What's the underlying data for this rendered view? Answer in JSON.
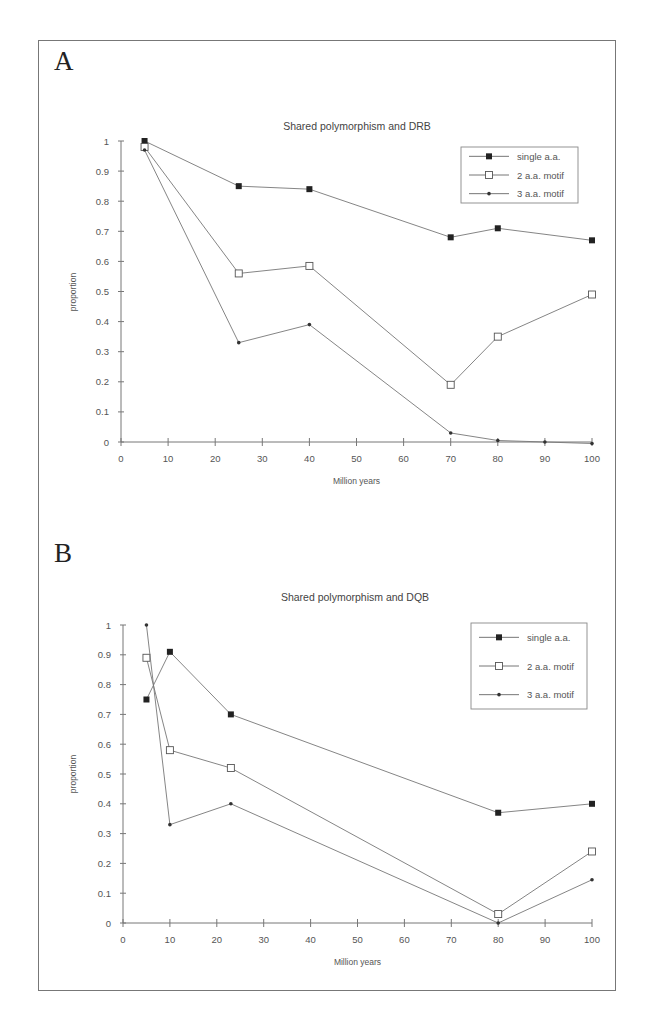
{
  "panels": [
    {
      "letter": "A",
      "title": "Shared polymorphism and DRB"
    },
    {
      "letter": "B",
      "title": "Shared polymorphism and DQB"
    }
  ],
  "chart_data": [
    {
      "type": "line",
      "panel": "A",
      "title": "Shared polymorphism and DRB",
      "xlabel": "Million years",
      "ylabel": "proportion",
      "xlim": [
        0,
        100
      ],
      "ylim": [
        0,
        1
      ],
      "xticks": [
        0,
        10,
        20,
        30,
        40,
        50,
        60,
        70,
        80,
        90,
        100
      ],
      "yticks": [
        0,
        0.1,
        0.2,
        0.3,
        0.4,
        0.5,
        0.6,
        0.7,
        0.8,
        0.9,
        1
      ],
      "ytick_labels": [
        "0",
        "0.1",
        "0.2",
        "0.3",
        "0.4",
        "0.5",
        "0.6",
        "0.7",
        "0.8",
        "0.9",
        "1"
      ],
      "grid": false,
      "legend_position": "upper right",
      "series": [
        {
          "name": "single a.a.",
          "marker": "filled-square",
          "x": [
            5,
            25,
            40,
            70,
            80,
            100
          ],
          "values": [
            1.0,
            0.85,
            0.84,
            0.68,
            0.71,
            0.67
          ]
        },
        {
          "name": "2 a.a. motif",
          "marker": "open-square",
          "x": [
            5,
            25,
            40,
            70,
            80,
            100
          ],
          "values": [
            0.98,
            0.56,
            0.585,
            0.19,
            0.35,
            0.49
          ]
        },
        {
          "name": "3 a.a. motif",
          "marker": "small-dot",
          "x": [
            5,
            25,
            40,
            70,
            80,
            90,
            100
          ],
          "values": [
            0.97,
            0.33,
            0.39,
            0.03,
            0.005,
            0.0,
            -0.005
          ]
        }
      ]
    },
    {
      "type": "line",
      "panel": "B",
      "title": "Shared polymorphism and DQB",
      "xlabel": "Million years",
      "ylabel": "proportion",
      "xlim": [
        0,
        100
      ],
      "ylim": [
        0,
        1
      ],
      "xticks": [
        0,
        10,
        20,
        30,
        40,
        50,
        60,
        70,
        80,
        90,
        100
      ],
      "yticks": [
        0,
        0.1,
        0.2,
        0.3,
        0.4,
        0.5,
        0.6,
        0.7,
        0.8,
        0.9,
        1
      ],
      "ytick_labels": [
        "0",
        "0.1",
        "0.2",
        "0.3",
        "0.4",
        "0.5",
        "0.6",
        "0.7",
        "0.8",
        "0.9",
        "1"
      ],
      "grid": false,
      "legend_position": "upper right",
      "series": [
        {
          "name": "single a.a.",
          "marker": "filled-square",
          "x": [
            5,
            10,
            23,
            80,
            100
          ],
          "values": [
            0.75,
            0.91,
            0.7,
            0.37,
            0.4
          ]
        },
        {
          "name": "2 a.a. motif",
          "marker": "open-square",
          "x": [
            5,
            10,
            23,
            80,
            100
          ],
          "values": [
            0.89,
            0.58,
            0.52,
            0.03,
            0.24
          ]
        },
        {
          "name": "3 a.a. motif",
          "marker": "small-dot",
          "x": [
            5,
            10,
            23,
            80,
            100
          ],
          "values": [
            1.0,
            0.33,
            0.4,
            0.0,
            0.145
          ]
        }
      ]
    }
  ]
}
